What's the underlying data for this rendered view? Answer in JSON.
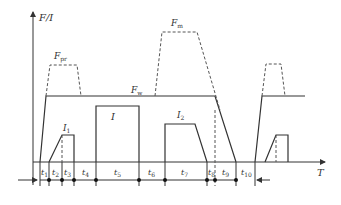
{
  "diagram": {
    "type": "timing-diagram",
    "y_axis_label": "F/I",
    "x_axis_label": "T",
    "curves": {
      "F_w": {
        "label": "F",
        "sub": "w",
        "style": "solid"
      },
      "F_pr": {
        "label": "F",
        "sub": "pr",
        "style": "dashed"
      },
      "F_m": {
        "label": "F",
        "sub": "m",
        "style": "dashed"
      },
      "I_1": {
        "label": "I",
        "sub": "1",
        "style": "solid"
      },
      "I": {
        "label": "I",
        "style": "solid"
      },
      "I_2": {
        "label": "I",
        "sub": "2",
        "style": "solid"
      }
    },
    "intervals": [
      {
        "label": "t",
        "sub": "1"
      },
      {
        "label": "t",
        "sub": "2"
      },
      {
        "label": "t",
        "sub": "3"
      },
      {
        "label": "t",
        "sub": "4"
      },
      {
        "label": "t",
        "sub": "5"
      },
      {
        "label": "t",
        "sub": "6"
      },
      {
        "label": "t",
        "sub": "7"
      },
      {
        "label": "t",
        "sub": "8"
      },
      {
        "label": "t",
        "sub": "9"
      },
      {
        "label": "t",
        "sub": "10"
      }
    ],
    "line_color": "#333333",
    "dash_color": "#555555"
  }
}
